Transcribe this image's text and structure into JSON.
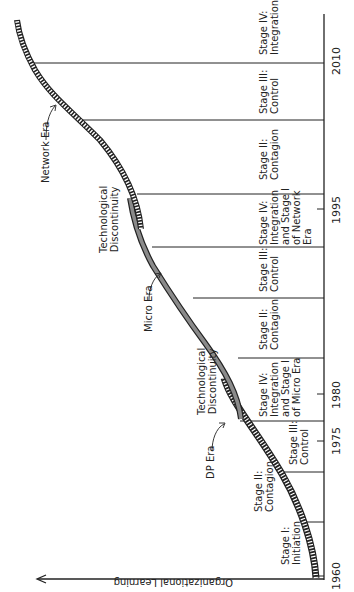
{
  "axes": {
    "y_label": "Organizational Learning",
    "x_ticks": [
      "1960",
      "1975",
      "1980",
      "1995",
      "2010"
    ]
  },
  "eras": [
    {
      "name": "DP Era",
      "label": "DP Era"
    },
    {
      "name": "Micro Era",
      "label": "Micro Era"
    },
    {
      "name": "Network Era",
      "label": "Network Era"
    }
  ],
  "discontinuities": [
    {
      "label_line1": "Technological",
      "label_line2": "Discontinuity"
    },
    {
      "label_line1": "Technological",
      "label_line2": "Discontinuity"
    }
  ],
  "stages": [
    {
      "line1": "Stage I:",
      "line2": "Initiation",
      "line3": "",
      "line4": ""
    },
    {
      "line1": "Stage II:",
      "line2": "Contagion",
      "line3": "",
      "line4": ""
    },
    {
      "line1": "Stage III:",
      "line2": "Control",
      "line3": "",
      "line4": ""
    },
    {
      "line1": "Stage IV:",
      "line2": "Integration",
      "line3": "and Stage I",
      "line4": "of Micro Era"
    },
    {
      "line1": "Stage II:",
      "line2": "Contagion",
      "line3": "",
      "line4": ""
    },
    {
      "line1": "Stage III:",
      "line2": "Control",
      "line3": "",
      "line4": ""
    },
    {
      "line1": "Stage IV:",
      "line2": "Integration",
      "line3": "and Stage I",
      "line4": "of Network"
    },
    {
      "line1": "Stage II:",
      "line2": "Contagion",
      "line3": "",
      "line4": ""
    },
    {
      "line1": "Stage III:",
      "line2": "Control",
      "line3": "",
      "line4": ""
    },
    {
      "line1": "Stage IV:",
      "line2": "Integration",
      "line3": "",
      "line4": ""
    }
  ],
  "stage_extra": {
    "network_era_word": "Era"
  },
  "colors": {
    "ink": "#222222",
    "micro_fill": "#8a8a8a",
    "background": "#ffffff"
  }
}
